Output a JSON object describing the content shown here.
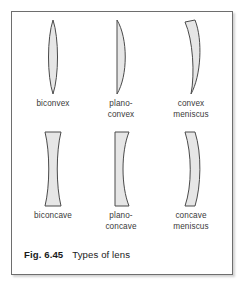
{
  "figure": {
    "caption_figure_number": "Fig. 6.45",
    "caption_title": "Types of lens",
    "border_color": "#6e6e6e",
    "background_color": "#ffffff"
  },
  "style": {
    "lens_fill_color": "#e6e6e6",
    "lens_stroke_color": "#4a4a4a",
    "label_color": "#3a3a3a"
  },
  "lenses": [
    {
      "id": "biconvex",
      "label": "biconvex",
      "row": 0,
      "column": 0,
      "shape": "lens-biconvex",
      "description": "both surfaces convex, pointed top and bottom"
    },
    {
      "id": "plano-convex",
      "label": "plano-\nconvex",
      "row": 0,
      "column": 1,
      "shape": "lens-plano-convex",
      "description": "flat left surface, convex right surface"
    },
    {
      "id": "convex-meniscus",
      "label": "convex\nmeniscus",
      "row": 0,
      "column": 2,
      "shape": "lens-convex-meniscus",
      "description": "crescent, both surfaces curved in same direction, thicker in middle"
    },
    {
      "id": "biconcave",
      "label": "biconcave",
      "row": 1,
      "column": 0,
      "shape": "lens-biconcave",
      "description": "both surfaces concave, hourglass with flat top and bottom"
    },
    {
      "id": "plano-concave",
      "label": "plano-\nconcave",
      "row": 1,
      "column": 1,
      "shape": "lens-plano-concave",
      "description": "flat left surface, concave right surface"
    },
    {
      "id": "concave-meniscus",
      "label": "concave\nmeniscus",
      "row": 1,
      "column": 2,
      "shape": "lens-concave-meniscus",
      "description": "crescent band, both surfaces curved in same direction, thinner in middle"
    }
  ]
}
